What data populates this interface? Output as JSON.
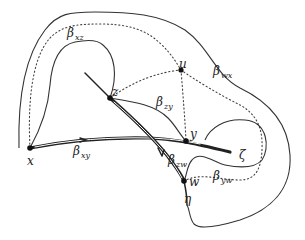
{
  "diagram": {
    "points": [
      {
        "id": "x",
        "label": "x",
        "cx": 30,
        "cy": 148
      },
      {
        "id": "z",
        "label": "z",
        "cx": 110,
        "cy": 98
      },
      {
        "id": "u",
        "label": "u",
        "cx": 181,
        "cy": 70
      },
      {
        "id": "y",
        "label": "y",
        "cx": 186,
        "cy": 141
      },
      {
        "id": "w",
        "label": "w",
        "cx": 184,
        "cy": 181
      }
    ],
    "curve_labels": {
      "beta_xz": {
        "greek": "β",
        "sub": "xz"
      },
      "beta_wx": {
        "greek": "β",
        "sub": "wx"
      },
      "beta_zy": {
        "greek": "β",
        "sub": "zy"
      },
      "beta_xy": {
        "greek": "β",
        "sub": "xy"
      },
      "beta_zw": {
        "greek": "β",
        "sub": "zw"
      },
      "beta_yw": {
        "greek": "β",
        "sub": "yw"
      }
    },
    "line_labels": {
      "zeta": "ζ",
      "eta": "η"
    }
  }
}
